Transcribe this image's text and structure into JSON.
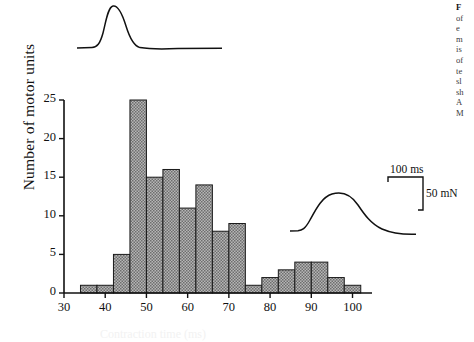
{
  "figure": {
    "ylabel": "Number of motor units",
    "xlabel_partial": "Contraction time (ms)"
  },
  "scale_bar": {
    "time_label": "100 ms",
    "force_label": "50 mN"
  },
  "caption_lines": [
    "F",
    "of",
    "e",
    "m",
    "is",
    "of",
    "te",
    "sl",
    "sh",
    "A",
    "M"
  ],
  "colors": {
    "axis": "#111111",
    "bar_edge": "#1a1a1a",
    "bar_fill": "#9a9a9a",
    "trace": "#111111"
  },
  "chart_data": {
    "type": "bar",
    "title": "",
    "xlabel": "",
    "ylabel": "Number of motor units",
    "xlim": [
      30,
      104
    ],
    "ylim": [
      0,
      25
    ],
    "xticks": [
      30,
      40,
      50,
      60,
      70,
      80,
      90,
      100
    ],
    "yticks": [
      0,
      5,
      10,
      15,
      20,
      25
    ],
    "xtick_labels": [
      "30",
      "40",
      "50",
      "60",
      "70",
      "80",
      "90",
      "100"
    ],
    "ytick_labels": [
      "0",
      "5",
      "10",
      "15",
      "20",
      "25"
    ],
    "grid": false,
    "legend": null,
    "bin_width": 4,
    "bin_edges": [
      34,
      38,
      42,
      46,
      50,
      54,
      58,
      62,
      66,
      70,
      74,
      78,
      82,
      86,
      90,
      94,
      98,
      102
    ],
    "categories": [
      "34-38",
      "38-42",
      "42-46",
      "46-50",
      "50-54",
      "54-58",
      "58-62",
      "62-66",
      "66-70",
      "70-74",
      "74-78",
      "78-82",
      "82-86",
      "86-90",
      "90-94",
      "94-98",
      "98-102"
    ],
    "values": [
      1,
      1,
      5,
      25,
      15,
      16,
      11,
      14,
      8,
      9,
      1,
      2,
      3,
      4,
      4,
      2,
      1
    ],
    "annotations": [
      {
        "name": "fast-twitch-trace",
        "description": "twitch waveform above left peak"
      },
      {
        "name": "slow-twitch-trace",
        "description": "twitch waveform above right mode"
      },
      {
        "name": "scale-bar",
        "time": "100 ms",
        "force": "50 mN"
      }
    ]
  }
}
